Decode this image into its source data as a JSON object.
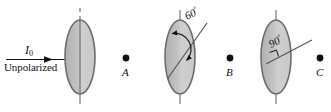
{
  "figure": {
    "background_color": "#ffffff",
    "width": 331,
    "height": 112
  },
  "beam": {
    "intensity_label": "I",
    "intensity_subscript": "0",
    "source_label": "Unpolarized",
    "arrow_color": "#111111"
  },
  "polarizers": [
    {
      "id": "polarizer-1",
      "angle_label": "",
      "angle_degrees": 0,
      "axis_orientation": "vertical",
      "fill_color": "#bdbdbd",
      "stroke_color": "#6e6e6e",
      "center_x": 80,
      "center_y": 57,
      "rx": 15,
      "ry": 37
    },
    {
      "id": "polarizer-2",
      "angle_label": "60",
      "angle_unit": "°",
      "angle_degrees": 60,
      "axis_orientation": "tilted",
      "fill_color": "#bdbdbd",
      "stroke_color": "#6e6e6e",
      "center_x": 180,
      "center_y": 57,
      "rx": 15,
      "ry": 37
    },
    {
      "id": "polarizer-3",
      "angle_label": "90",
      "angle_unit": "°",
      "angle_degrees": 90,
      "axis_orientation": "horizontal",
      "fill_color": "#bdbdbd",
      "stroke_color": "#6e6e6e",
      "center_x": 276,
      "center_y": 57,
      "rx": 15,
      "ry": 37
    }
  ],
  "points": [
    {
      "id": "point-a",
      "label": "A",
      "x": 126,
      "y": 58
    },
    {
      "id": "point-b",
      "label": "B",
      "x": 230,
      "y": 58
    },
    {
      "id": "point-c",
      "label": "C",
      "x": 320,
      "y": 58
    }
  ],
  "colors": {
    "ink": "#111111",
    "ellipse_fill": "#bdbdbd",
    "ellipse_fill_light": "#d2d2d2",
    "ellipse_stroke": "#6e6e6e",
    "axis_line": "#5a5a5a"
  }
}
